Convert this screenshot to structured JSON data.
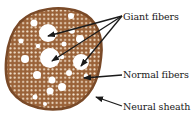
{
  "diagram": {
    "colors": {
      "tissue": "#9a6238",
      "tissue_edge": "#7a4a28",
      "fiber_dot": "#f3e2cc",
      "giant_fiber": "#ffffff",
      "arrow": "#1a1a1a"
    },
    "labels": [
      {
        "id": "giant",
        "text": "Giant fibers",
        "x": 123,
        "y": 11
      },
      {
        "id": "normal",
        "text": "Normal fibers",
        "x": 123,
        "y": 69
      },
      {
        "id": "sheath",
        "text": "Neural sheath",
        "x": 123,
        "y": 101
      }
    ]
  }
}
